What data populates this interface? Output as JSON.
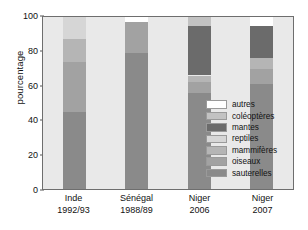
{
  "chart_data": {
    "type": "bar",
    "variant": "stacked-percent",
    "title": "",
    "xlabel": "",
    "ylabel": "pourcentage",
    "ylim": [
      0,
      100
    ],
    "yticks": [
      0,
      20,
      40,
      60,
      80,
      100
    ],
    "grid": false,
    "legend_position": "inside-right",
    "plot_background": "#e9e9e9",
    "categories": [
      "Inde 1992/93",
      "Sénégal 1988/89",
      "Niger 2006",
      "Niger 2007"
    ],
    "category_labels": [
      {
        "line1": "Inde",
        "line2": "1992/93"
      },
      {
        "line1": "Sénégal",
        "line2": "1988/89"
      },
      {
        "line1": "Niger",
        "line2": "2006"
      },
      {
        "line1": "Niger",
        "line2": "2007"
      }
    ],
    "series": [
      {
        "name": "sauterelles",
        "color": "#8a8a8a",
        "values": [
          45,
          79,
          56,
          61
        ]
      },
      {
        "name": "oiseaux",
        "color": "#a2a2a2",
        "values": [
          29,
          18,
          6,
          9
        ]
      },
      {
        "name": "mammifères",
        "color": "#b5b5b5",
        "values": [
          13,
          0,
          4,
          6
        ]
      },
      {
        "name": "reptiles",
        "color": "#d6d6d6",
        "values": [
          13,
          0,
          0,
          0
        ]
      },
      {
        "name": "mantes",
        "color": "#6b6b6b",
        "values": [
          0,
          0,
          29,
          19
        ]
      },
      {
        "name": "coléoptères",
        "color": "#c2c2c2",
        "values": [
          0,
          0,
          5,
          0
        ]
      },
      {
        "name": "autres",
        "color": "#ffffff",
        "values": [
          0,
          3,
          0,
          5
        ]
      }
    ],
    "stack_order": [
      "sauterelles",
      "oiseaux",
      "mammifères",
      "reptiles",
      "mantes",
      "coléoptères",
      "autres"
    ]
  },
  "legend": {
    "entries": [
      {
        "label": "autres",
        "color": "#ffffff"
      },
      {
        "label": "coléoptères",
        "color": "#c2c2c2"
      },
      {
        "label": "mantes",
        "color": "#6b6b6b"
      },
      {
        "label": "reptiles",
        "color": "#d6d6d6"
      },
      {
        "label": "mammifères",
        "color": "#b5b5b5"
      },
      {
        "label": "oiseaux",
        "color": "#a2a2a2"
      },
      {
        "label": "sauterelles",
        "color": "#8a8a8a"
      }
    ]
  }
}
